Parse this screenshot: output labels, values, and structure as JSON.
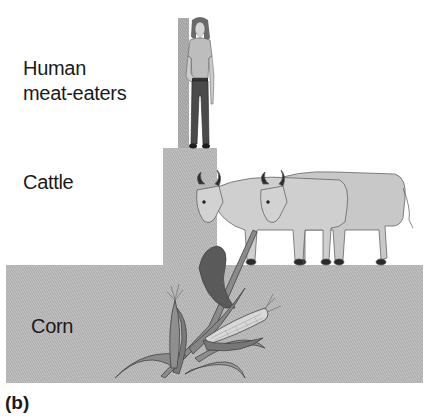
{
  "figure": {
    "panel_label": "(b)",
    "type": "trophic pyramid (energy/biomass)",
    "levels": [
      {
        "id": "human",
        "label_line1": "Human",
        "label_line2": "meat-eaters",
        "illustration": "woman-standing"
      },
      {
        "id": "cattle",
        "label": "Cattle",
        "illustration": "two-cows"
      },
      {
        "id": "corn",
        "label": "Corn",
        "illustration": "corn-plant"
      }
    ]
  },
  "colors": {
    "bar_fill": "#b7b7b7",
    "text": "#1a1a1a",
    "background": "#ffffff"
  }
}
